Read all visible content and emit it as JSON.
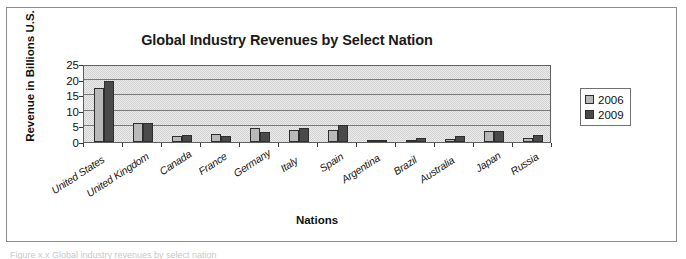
{
  "figure": {
    "caption_partial": "Figure x.x  Global industry revenues by select nation"
  },
  "legend": {
    "position": "right",
    "entries": [
      {
        "label": "2006",
        "color": "#b9b9b9"
      },
      {
        "label": "2009",
        "color": "#4a4a4a"
      }
    ]
  },
  "axes": {
    "y_ticks": [
      "25",
      "20",
      "15",
      "10",
      "5",
      "0"
    ]
  },
  "chart_data": {
    "type": "bar",
    "title": "Global Industry Revenues by Select Nation",
    "xlabel": "Nations",
    "ylabel": "Revenue in Billions U.S.",
    "ylim": [
      0,
      25
    ],
    "yticks": [
      0,
      5,
      10,
      15,
      20,
      25
    ],
    "grid": true,
    "legend_position": "right",
    "categories": [
      "United States",
      "United Kingdom",
      "Canada",
      "France",
      "Germany",
      "Italy",
      "Spain",
      "Argentina",
      "Brazil",
      "Australia",
      "Japan",
      "Russia"
    ],
    "series": [
      {
        "name": "2006",
        "color": "#b9b9b9",
        "values": [
          17.3,
          6.0,
          1.9,
          2.6,
          4.6,
          3.8,
          3.9,
          0.3,
          0.8,
          1.0,
          3.6,
          1.3
        ]
      },
      {
        "name": "2009",
        "color": "#4a4a4a",
        "values": [
          19.5,
          6.0,
          2.1,
          1.8,
          3.3,
          4.5,
          5.5,
          0.3,
          1.2,
          1.9,
          3.4,
          2.1
        ]
      }
    ]
  }
}
